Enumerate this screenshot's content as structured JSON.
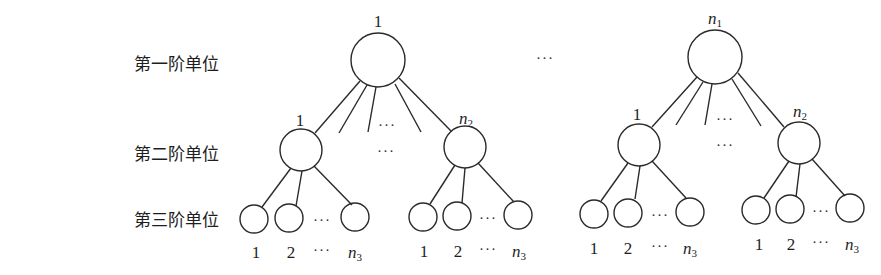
{
  "diagram": {
    "type": "hierarchical-tree",
    "level_labels": [
      "第一阶单位",
      "第二阶单位",
      "第三阶单位"
    ],
    "ellipsis": "···",
    "trees": [
      {
        "root_label": "1",
        "children": [
          {
            "label": "1",
            "leaves": [
              "1",
              "2",
              "···",
              "n3"
            ]
          },
          {
            "label": "n2",
            "leaves": [
              "1",
              "2",
              "···",
              "n3"
            ]
          }
        ]
      },
      {
        "root_label": "n1",
        "children": [
          {
            "label": "1",
            "leaves": [
              "1",
              "2",
              "···",
              "n3"
            ]
          },
          {
            "label": "n2",
            "leaves": [
              "1",
              "2",
              "···",
              "n3"
            ]
          }
        ]
      }
    ],
    "colors": {
      "stroke": "#2a2a2a",
      "text": "#1e1e1e",
      "background": "#ffffff"
    }
  },
  "labels": {
    "level1": "第一阶单位",
    "level2": "第二阶单位",
    "level3": "第三阶单位",
    "tree1_root": "1",
    "tree2_root_var": "n",
    "tree2_root_sub": "1",
    "child_first": "1",
    "child_last_var": "n",
    "child_last_sub": "2",
    "leaf_1": "1",
    "leaf_2": "2",
    "leaf_last_var": "n",
    "leaf_last_sub": "3",
    "dots": "···"
  }
}
